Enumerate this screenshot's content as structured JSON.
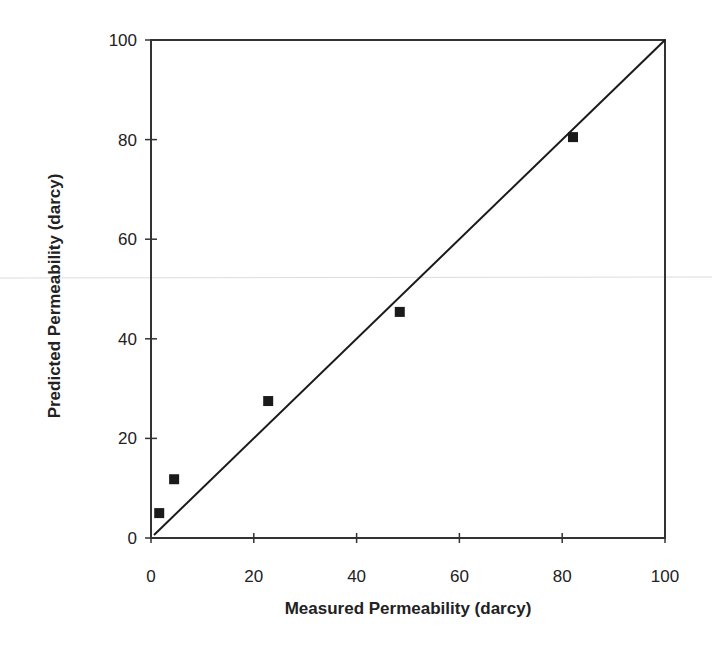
{
  "chart_data": {
    "type": "scatter",
    "title": "",
    "xlabel": "Measured Permeability (darcy)",
    "ylabel": "Predicted Permeability (darcy)",
    "xlim": [
      0,
      100
    ],
    "ylim": [
      0,
      100
    ],
    "x_ticks": [
      0,
      20,
      40,
      60,
      80,
      100
    ],
    "y_ticks": [
      0,
      20,
      40,
      60,
      80,
      100
    ],
    "grid": false,
    "legend": null,
    "series": [
      {
        "name": "Data",
        "marker": "square",
        "color": "#1a1a1a",
        "points": [
          {
            "x": 1.6,
            "y": 5.0
          },
          {
            "x": 4.5,
            "y": 11.8
          },
          {
            "x": 22.8,
            "y": 27.5
          },
          {
            "x": 48.4,
            "y": 45.4
          },
          {
            "x": 82.1,
            "y": 80.5
          }
        ]
      }
    ],
    "reference_line": {
      "name": "1:1 line",
      "from": [
        0,
        0
      ],
      "to": [
        100,
        100
      ],
      "color": "#1a1a1a"
    }
  },
  "layout": {
    "plot": {
      "left": 151,
      "top": 40,
      "right": 665,
      "bottom": 538
    },
    "frame_color": "#333333"
  }
}
